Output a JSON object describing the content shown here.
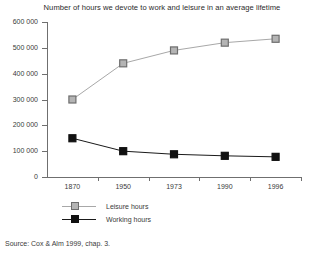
{
  "chart_data": {
    "type": "line",
    "title": "Number of hours we devote to work and leisure in an average lifetime",
    "xlabel": "",
    "ylabel": "",
    "categories": [
      "1870",
      "1950",
      "1973",
      "1990",
      "1996"
    ],
    "series": [
      {
        "name": "Leisure hours",
        "values": [
          300000,
          440000,
          490000,
          520000,
          535000
        ],
        "color": "#a8a8a8",
        "marker": "square",
        "marker_fill": "#b4b4b4",
        "marker_edge": "#6e6e6e"
      },
      {
        "name": "Working hours",
        "values": [
          150000,
          100000,
          88000,
          82000,
          78000
        ],
        "color": "#1a1a1a",
        "marker": "square",
        "marker_fill": "#111111",
        "marker_edge": "#111111"
      }
    ],
    "ylim": [
      0,
      600000
    ],
    "yticks": [
      0,
      100000,
      200000,
      300000,
      400000,
      500000,
      600000
    ],
    "ytick_labels": [
      "0",
      "100 000",
      "200 000",
      "300 000",
      "400 000",
      "500 000",
      "600 000"
    ],
    "grid": false,
    "legend_position": "below-left"
  },
  "source_note": "Source: Cox & Alm 1999, chap. 3."
}
